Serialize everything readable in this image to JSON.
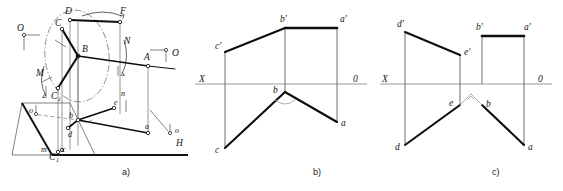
{
  "figure": {
    "captions": [
      {
        "id": "a",
        "text": "a)"
      },
      {
        "id": "b",
        "text": "b)"
      },
      {
        "id": "c",
        "text": "c)"
      }
    ]
  },
  "panel_a": {
    "name": "pictorial-projection-diagram",
    "labels": {
      "O_left": "O",
      "O_right": "O",
      "O_lower_right": "o",
      "o_left": "o",
      "C_upper": "C",
      "D": "D",
      "F": "F",
      "B": "B",
      "N": "N",
      "M": "M",
      "A": "A",
      "C1_upper": "C",
      "C1_upper_sub": "1",
      "C1_lower": "C",
      "C1_lower_sub": "1",
      "c_lower": "c",
      "d": "d",
      "b": "b",
      "e": "e",
      "n": "n",
      "a": "a",
      "m": "m",
      "H": "H"
    }
  },
  "panel_b": {
    "name": "orthographic-epure-b",
    "labels": {
      "X": "X",
      "O": "0",
      "a_prime": "a′",
      "b_prime": "b′",
      "c_prime": "c′",
      "a": "a",
      "b": "b",
      "c": "c"
    }
  },
  "panel_c": {
    "name": "orthographic-epure-c",
    "labels": {
      "X": "X",
      "O": "0",
      "a_prime": "a′",
      "b_prime": "b′",
      "d_prime": "d′",
      "e_prime": "e′",
      "a": "a",
      "b": "b",
      "d": "d",
      "e": "e"
    }
  },
  "style": {
    "stroke_heavy": "#111111",
    "stroke_thin": "#3a3a3a",
    "stroke_light": "#8a8a8a",
    "background": "#ffffff"
  }
}
